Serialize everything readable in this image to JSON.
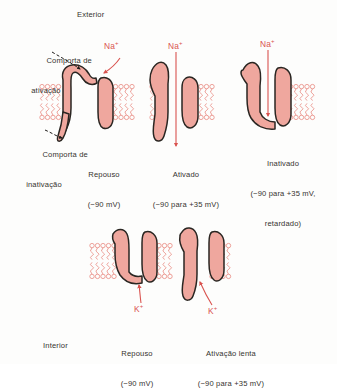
{
  "figure": {
    "title_exterior": "Exterior",
    "title_interior": "Interior",
    "colors": {
      "protein_fill": "#efa79e",
      "protein_outline": "#2a2622",
      "membrane": "#e98a82",
      "ion_label": "#d9534f",
      "text": "#35332f",
      "background": "#fdfdfc"
    }
  },
  "annotations": {
    "activation_gate": {
      "line1": "Comporta de",
      "line2": "ativação"
    },
    "inactivation_gate": {
      "line1": "Comporta de",
      "line2": "inativação"
    }
  },
  "sodium_row": {
    "ion_symbol": "Na",
    "ion_charge": "+",
    "states": [
      {
        "name": "resting",
        "ion_label": "Na+",
        "caption": [
          "Repouso",
          "(−90 mV)"
        ]
      },
      {
        "name": "activated",
        "ion_label": "Na+",
        "caption": [
          "Ativado",
          "(−90 para +35 mV)"
        ]
      },
      {
        "name": "inactivated",
        "ion_label": "Na+",
        "caption": [
          "Inativado",
          "(−90 para +35 mV,",
          "retardado)"
        ]
      }
    ]
  },
  "potassium_row": {
    "ion_symbol": "K",
    "ion_charge": "+",
    "states": [
      {
        "name": "resting",
        "ion_label": "K+",
        "caption": [
          "Repouso",
          "(−90 mV)"
        ]
      },
      {
        "name": "slow-activation",
        "ion_label": "K+",
        "caption": [
          "Ativação lenta",
          "(−90 para +35 mV)"
        ]
      }
    ]
  }
}
